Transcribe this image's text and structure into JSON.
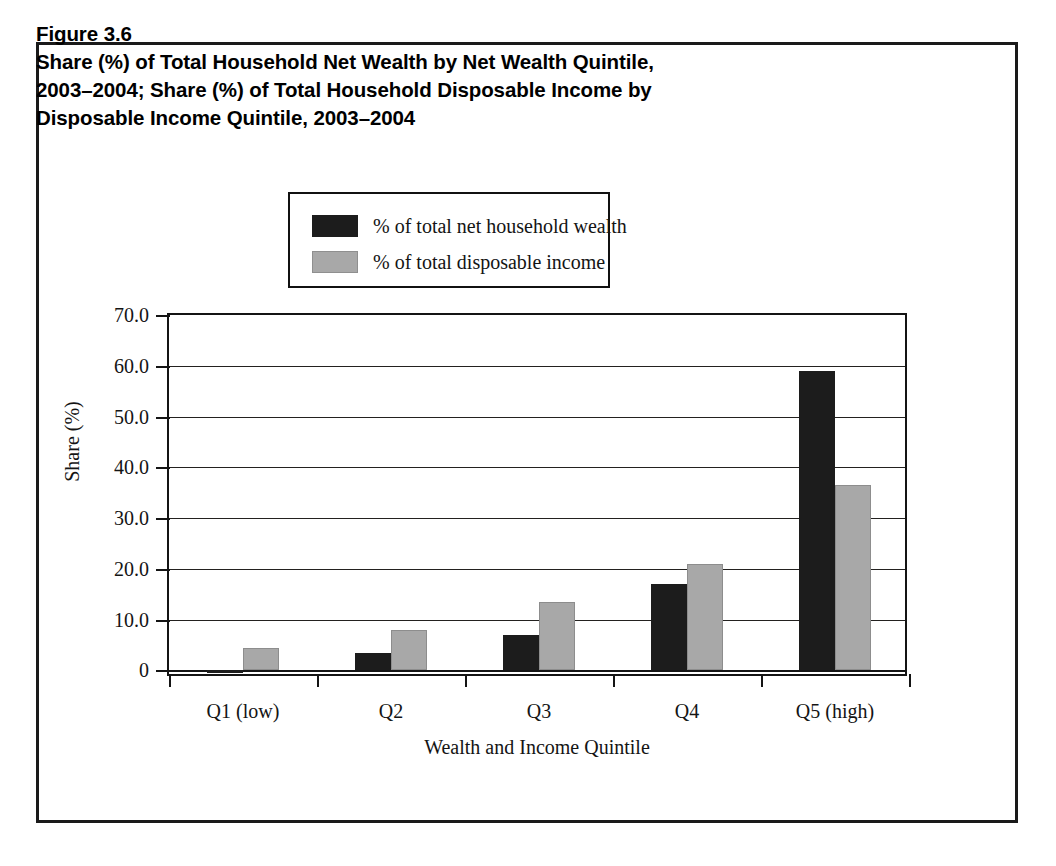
{
  "figure": {
    "label": "Figure 3.6",
    "title_lines": [
      "Figure 3.6",
      "Share (%) of Total Household Net Wealth by Net Wealth Quintile,",
      "2003–2004; Share (%) of Total Household Disposable Income by",
      "Disposable Income Quintile, 2003–2004"
    ]
  },
  "colors": {
    "series_wealth": "#1c1c1c",
    "series_income": "#a8a8a8",
    "axis": "#141414",
    "frame": "#1a1a1a",
    "background": "#ffffff"
  },
  "legend": {
    "position": "above-plot",
    "entries": [
      {
        "label": "% of total net household wealth",
        "swatch": "dark"
      },
      {
        "label": "% of total disposable income",
        "swatch": "grey"
      }
    ]
  },
  "chart_data": {
    "type": "bar",
    "title": "Share (%) of Total Household Net Wealth by Net Wealth Quintile, 2003–2004; Share (%) of Total Household Disposable Income by Disposable Income Quintile, 2003–2004",
    "xlabel": "Wealth and Income Quintile",
    "ylabel": "Share (%)",
    "categories": [
      "Q1 (low)",
      "Q2",
      "Q3",
      "Q4",
      "Q5 (high)"
    ],
    "series": [
      {
        "name": "% of total net household wealth",
        "values": [
          -0.5,
          3.5,
          7.0,
          17.0,
          59.0
        ]
      },
      {
        "name": "% of total disposable income",
        "values": [
          4.5,
          8.0,
          13.5,
          21.0,
          36.5
        ]
      }
    ],
    "ylim": [
      -1.5,
      70.0
    ],
    "ytick_labels": [
      "70.0",
      "60.0",
      "50.0",
      "40.0",
      "30.0",
      "20.0",
      "10.0",
      "0"
    ],
    "ytick_values": [
      70.0,
      60.0,
      50.0,
      40.0,
      30.0,
      20.0,
      10.0,
      0
    ],
    "grid": true,
    "grid_axis": "y",
    "legend_position": "above-plot"
  }
}
